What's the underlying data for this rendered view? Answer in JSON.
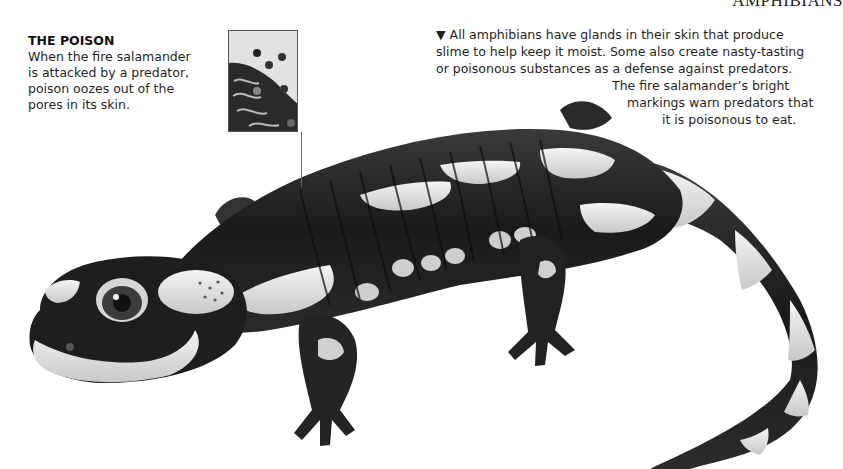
{
  "page": {
    "running_head": "AMPHIBIANS"
  },
  "poison_callout": {
    "title": "THE POISON",
    "lines": [
      "When the fire salamander",
      "is attacked by a predator,",
      "poison oozes out of the",
      "pores in its skin."
    ]
  },
  "main_caption": {
    "marker": "▼",
    "lines": [
      "All amphibians have glands in their skin that produce",
      "slime to help keep it moist. Some also create nasty-tasting",
      "or poisonous substances as a defense against predators."
    ]
  },
  "warning_caption": {
    "lines": [
      "The fire salamander’s bright",
      "markings warn predators that",
      "it is poisonous to eat."
    ]
  },
  "illustration": {
    "subject": "fire salamander",
    "inset": "skin pores close-up",
    "palette": {
      "dark": "#1c1c1c",
      "mid": "#555555",
      "light": "#d9d9d9",
      "highlight": "#f2f2f2"
    }
  }
}
